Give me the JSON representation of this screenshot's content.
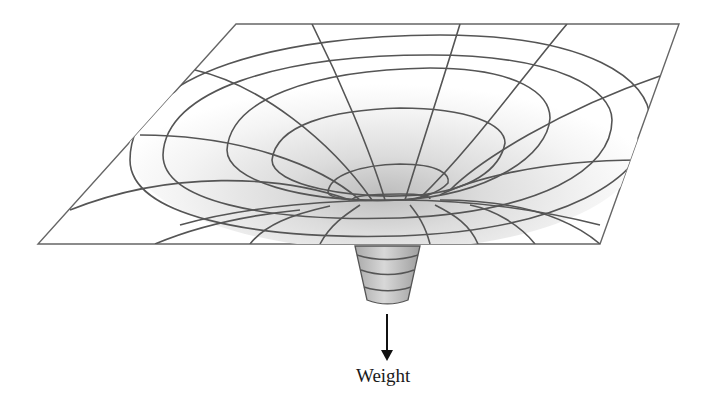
{
  "figure": {
    "weight_label": "Weight",
    "colors": {
      "grid_line": "#555555",
      "sheet_fill": "#ffffff",
      "funnel_shade": "#c8c8c8",
      "arrow": "#111111",
      "label": "#1a1a1a"
    },
    "parts": {
      "sheet": "grid-sheet",
      "funnel": "gravity-well",
      "weight": "weight-cone",
      "arrow": "down-arrow"
    }
  }
}
